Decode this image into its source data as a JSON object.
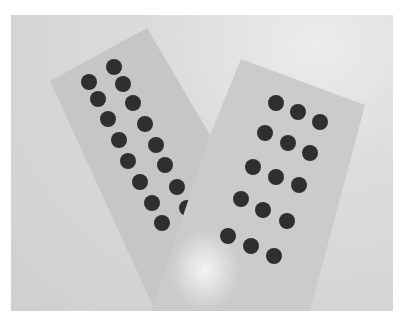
{
  "image": {
    "description": "Grayscale photo of two rectangular cards overlapping in a V shape, each with rows of dark circular dots",
    "width": 405,
    "height": 321,
    "frame": {
      "x": 11,
      "y": 15,
      "w": 382,
      "h": 296
    },
    "colors": {
      "page": "#ffffff",
      "background": "#d6d6d6",
      "card_left": "#c6c6c6",
      "card_right": "#cbcbcb",
      "dot": "#2f2f2f",
      "glare": "#f4f4f4"
    },
    "cards": [
      {
        "name": "left-card",
        "points": "50,81 147,28 210,135 195,200 153,306"
      },
      {
        "name": "right-card",
        "points": "210,135 241,59 365,105 310,311 152,311 153,306"
      }
    ],
    "dot_radius": 8,
    "dots_left": [
      [
        89,
        82
      ],
      [
        98,
        99
      ],
      [
        108,
        119
      ],
      [
        119,
        140
      ],
      [
        128,
        161
      ],
      [
        140,
        182
      ],
      [
        152,
        203
      ],
      [
        162,
        223
      ],
      [
        114,
        67
      ],
      [
        123,
        84
      ],
      [
        133,
        103
      ],
      [
        145,
        124
      ],
      [
        156,
        145
      ],
      [
        165,
        165
      ],
      [
        177,
        187
      ],
      [
        187,
        208
      ]
    ],
    "dots_right": [
      [
        276,
        103
      ],
      [
        298,
        112
      ],
      [
        320,
        122
      ],
      [
        265,
        133
      ],
      [
        288,
        143
      ],
      [
        310,
        153
      ],
      [
        253,
        167
      ],
      [
        276,
        177
      ],
      [
        299,
        185
      ],
      [
        241,
        199
      ],
      [
        263,
        210
      ],
      [
        287,
        221
      ],
      [
        228,
        236
      ],
      [
        251,
        246
      ],
      [
        274,
        256
      ]
    ],
    "dot_counts": {
      "left_card_visible": 16,
      "right_card": 15
    }
  }
}
